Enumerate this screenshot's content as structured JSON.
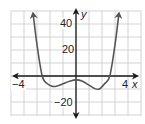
{
  "chart_data": {
    "type": "line",
    "title": "",
    "xlabel": "x",
    "ylabel": "y",
    "xlim": [
      -4.5,
      5
    ],
    "ylim": [
      -25,
      50
    ],
    "grid": true,
    "x_tick_labels": [
      "-4",
      "4"
    ],
    "y_tick_labels": [
      "40",
      "20",
      "-20"
    ],
    "x_grid_step": 1,
    "y_grid_step": 10,
    "series": [
      {
        "name": "f(x)",
        "description": "even-degree polynomial (quartic-like), both ends rising to +infinity with arrows",
        "x": [
          -3.3,
          -3.0,
          -2.6,
          -2.2,
          -1.8,
          -1.4,
          -1.0,
          -0.5,
          0.0,
          0.5,
          1.0,
          1.4,
          1.8,
          2.2,
          2.6,
          3.0,
          3.3
        ],
        "y": [
          48,
          24,
          0,
          -6,
          -8,
          -7.5,
          -6,
          -4,
          -3,
          -4,
          -7,
          -9.5,
          -10,
          -6,
          0,
          24,
          48
        ]
      }
    ],
    "annotations": {
      "x_intercepts_approx": [
        -2.6,
        2.6
      ],
      "local_min_approx": [
        [
          -1.6,
          -8
        ],
        [
          1.7,
          -10
        ]
      ],
      "local_max_approx": [
        0,
        -3
      ]
    }
  },
  "labels": {
    "x_neg4": "−4",
    "x_pos4": "4",
    "x_axis": "x",
    "y_40": "40",
    "y_20": "20",
    "y_neg20": "−20",
    "y_axis": "y"
  },
  "colors": {
    "grid": "#c8c8c8",
    "axis": "#1a1a1a",
    "curve": "#555555"
  }
}
